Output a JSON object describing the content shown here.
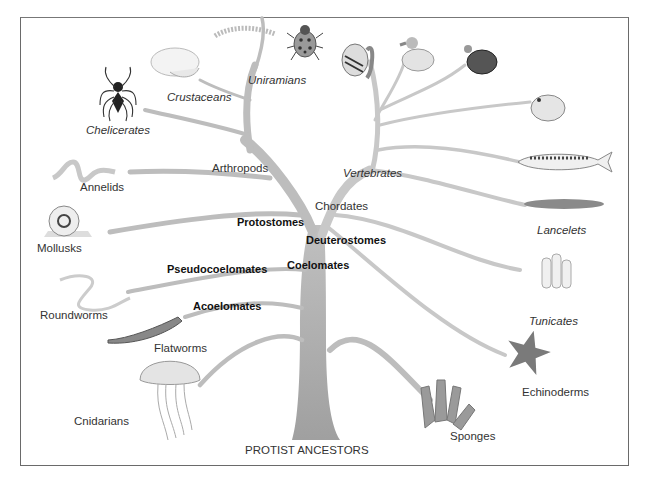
{
  "diagram": {
    "root_label": "PROTIST ANCESTORS",
    "grade_labels": {
      "protostomes": "Protostomes",
      "deuterostomes": "Deuterostomes",
      "coelomates": "Coelomates",
      "pseudocoelomates": "Pseudocoelomates",
      "acoelomates": "Acoelomates"
    },
    "clade_labels": {
      "arthropods": "Arthropods",
      "chordates": "Chordates",
      "vertebrates": "Vertebrates"
    },
    "taxa": {
      "chelicerates": "Chelicerates",
      "crustaceans": "Crustaceans",
      "uniramians": "Uniramians",
      "annelids": "Annelids",
      "mollusks": "Mollusks",
      "roundworms": "Roundworms",
      "flatworms": "Flatworms",
      "cnidarians": "Cnidarians",
      "sponges": "Sponges",
      "echinoderms": "Echinoderms",
      "tunicates": "Tunicates",
      "lancelets": "Lancelets"
    },
    "illustrations": [
      "spider",
      "crab",
      "centipede",
      "ladybug",
      "chipmunk",
      "duck",
      "turtle",
      "frog",
      "fish",
      "lancelet",
      "earthworm",
      "snail",
      "roundworm",
      "flatworm",
      "jellyfish",
      "sponge",
      "starfish",
      "tunicate"
    ],
    "colors": {
      "trunk": "#9a9a9a",
      "branch": "#c4c4c4",
      "frame": "#6a6a6a"
    }
  }
}
